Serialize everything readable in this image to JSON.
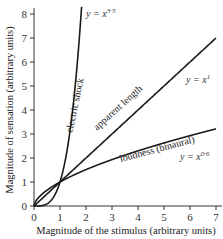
{
  "chart_data": {
    "type": "line",
    "title": "",
    "xlabel": "Magnitude of the stimulus (arbitrary units)",
    "ylabel": "Magnitude of sensation (arbitrary units)",
    "xlim": [
      0,
      7
    ],
    "ylim": [
      0,
      8
    ],
    "xticks": [
      0,
      1,
      2,
      3,
      4,
      5,
      6,
      7
    ],
    "yticks": [
      0,
      1,
      2,
      3,
      4,
      5,
      6,
      7,
      8
    ],
    "grid": false,
    "legend": "none (inline curve labels)",
    "series": [
      {
        "name": "electric shock",
        "equation": "y = x^3.5",
        "exponent": 3.5,
        "x": [
          0,
          0.5,
          0.8,
          1.0,
          1.2,
          1.4,
          1.6,
          1.8
        ],
        "y": [
          0,
          0.09,
          0.46,
          1.0,
          1.89,
          3.25,
          5.18,
          7.82
        ]
      },
      {
        "name": "apparent length",
        "equation": "y = x^1",
        "exponent": 1,
        "x": [
          0,
          1,
          2,
          3,
          4,
          5,
          6,
          7
        ],
        "y": [
          0,
          1,
          2,
          3,
          4,
          5,
          6,
          7
        ]
      },
      {
        "name": "loudness (binaural)",
        "equation": "y = x^0.6",
        "exponent": 0.6,
        "x": [
          0,
          1,
          2,
          3,
          4,
          5,
          6,
          7
        ],
        "y": [
          0,
          1.0,
          1.52,
          1.93,
          2.3,
          2.63,
          2.93,
          3.21
        ]
      }
    ],
    "annotations": [
      {
        "text": "y = x",
        "superscript": "3·5",
        "near": "top of electric shock curve"
      },
      {
        "text": "y = x",
        "superscript": "1",
        "near": "right end of apparent length line"
      },
      {
        "text": "y = x",
        "superscript": "0·6",
        "near": "right end of loudness curve"
      }
    ]
  },
  "labels": {
    "curve_shock": "electric shock",
    "curve_length": "apparent length",
    "curve_loudness": "loudness (binaural)",
    "eq_base": "y = x",
    "eq_shock_exp": "3·5",
    "eq_length_exp": "1",
    "eq_loudness_exp": "0·6"
  }
}
